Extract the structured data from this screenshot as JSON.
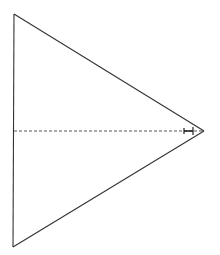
{
  "diagram": {
    "type": "isosceles-triangle-with-altitude",
    "background": "#ffffff",
    "stroke_color": "#333333",
    "vertices": {
      "top": [
        14,
        14
      ],
      "bottom": [
        13,
        247
      ],
      "apex": [
        204,
        131
      ]
    },
    "altitude": {
      "from": [
        14,
        131
      ],
      "to": [
        204,
        131
      ],
      "style": "dashed"
    },
    "tick_mark": {
      "x1": 184,
      "x2": 193,
      "y": 131
    }
  }
}
